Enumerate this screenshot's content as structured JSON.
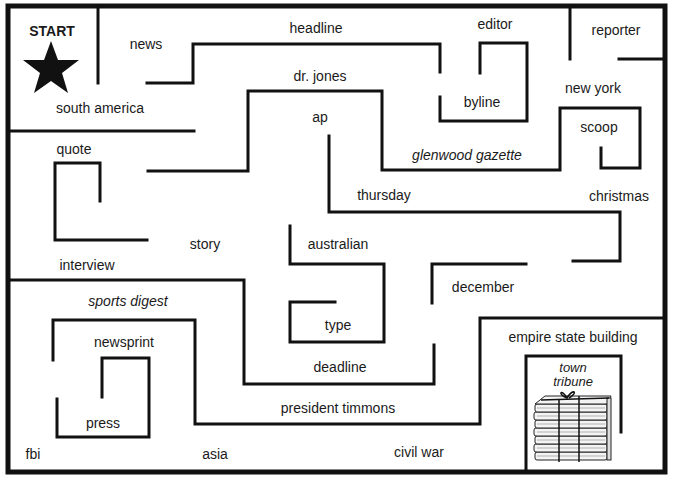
{
  "start": {
    "label": "START"
  },
  "finish": {
    "label_line1": "town",
    "label_line2": "tribune"
  },
  "colors": {
    "wall": "#111111",
    "background": "#ffffff",
    "text": "#1a1a1a"
  },
  "labels": {
    "news": "news",
    "headline": "headline",
    "editor": "editor",
    "reporter": "reporter",
    "south_america": "south america",
    "dr_jones": "dr. jones",
    "byline": "byline",
    "new_york": "new york",
    "ap": "ap",
    "scoop": "scoop",
    "quote": "quote",
    "glenwood_gazette": "glenwood gazette",
    "thursday": "thursday",
    "christmas": "christmas",
    "story": "story",
    "australian": "australian",
    "interview": "interview",
    "december": "december",
    "sports_digest": "sports digest",
    "type": "type",
    "empire_state_building": "empire state building",
    "newsprint": "newsprint",
    "deadline": "deadline",
    "president_timmons": "president timmons",
    "press": "press",
    "fbi": "fbi",
    "asia": "asia",
    "civil_war": "civil war"
  }
}
